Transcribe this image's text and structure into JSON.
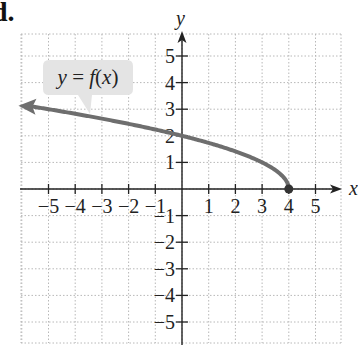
{
  "problem": {
    "label": "d."
  },
  "chart_data": {
    "type": "line",
    "title": "",
    "function_label": "y = f(x)",
    "function_label_parts": {
      "y": "y",
      "eq": "=",
      "f": "f",
      "open": "(",
      "x": "x",
      "close": ")"
    },
    "xlabel": "x",
    "ylabel": "y",
    "xlim": [
      -6,
      6
    ],
    "ylim": [
      -6,
      6
    ],
    "grid": true,
    "grid_style": "dotted",
    "x_ticks": [
      -5,
      -4,
      -3,
      -2,
      -1,
      1,
      2,
      3,
      4,
      5
    ],
    "x_tick_labels": [
      "−5",
      "−4",
      "−3",
      "−2",
      "−1",
      "1",
      "2",
      "3",
      "4",
      "5"
    ],
    "y_ticks": [
      5,
      4,
      3,
      2,
      1,
      -1,
      -2,
      -3,
      -4,
      -5
    ],
    "y_tick_labels": [
      "5",
      "4",
      "3",
      "2",
      "1",
      "−1",
      "−2",
      "−3",
      "−4",
      "−5"
    ],
    "series": [
      {
        "name": "f(x)",
        "description": "square-root shaped curve, arrow continuing to the left, closed endpoint at (4, 0)",
        "x": [
          -6,
          -5,
          -4,
          -3,
          -2,
          -1,
          0,
          1,
          2,
          3,
          3.5,
          3.8,
          4
        ],
        "y": [
          3.16,
          3.0,
          2.83,
          2.65,
          2.45,
          2.24,
          2.0,
          1.73,
          1.41,
          1.0,
          0.71,
          0.45,
          0.0
        ],
        "left_arrow": true,
        "endpoint": {
          "x": 4,
          "y": 0,
          "closed": true
        },
        "color": "#6e6e6e"
      }
    ],
    "key_points": [
      {
        "x": 0,
        "y": 2
      },
      {
        "x": 4,
        "y": 0
      }
    ],
    "callout_color": "#e4e4e4",
    "axis_color": "#222222",
    "grid_color": "#b8b8b8"
  }
}
